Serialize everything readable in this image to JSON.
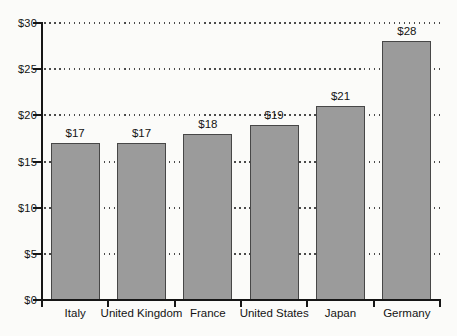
{
  "chart_data": {
    "type": "bar",
    "categories": [
      "Italy",
      "United Kingdom",
      "France",
      "United States",
      "Japan",
      "Germany"
    ],
    "values": [
      17,
      17,
      18,
      19,
      21,
      28
    ],
    "value_labels": [
      "$17",
      "$17",
      "$18",
      "$19",
      "$21",
      "$28"
    ],
    "title": "",
    "xlabel": "",
    "ylabel": "",
    "ylim": [
      0,
      30
    ],
    "y_tick_values": [
      0,
      5,
      10,
      15,
      20,
      25,
      30
    ],
    "y_tick_labels": [
      "$0",
      "$5",
      "$10",
      "$15",
      "$20",
      "$25",
      "$30"
    ],
    "grid": "dotted horizontal gridlines at each $5 level",
    "legend": "none",
    "colors": {
      "bar_fill": "#9b9b9b",
      "bar_border": "#474747",
      "axis": "#161616",
      "grid_dots": "#4a4a4a",
      "background": "#fbfbf9",
      "text": "#141414"
    }
  }
}
